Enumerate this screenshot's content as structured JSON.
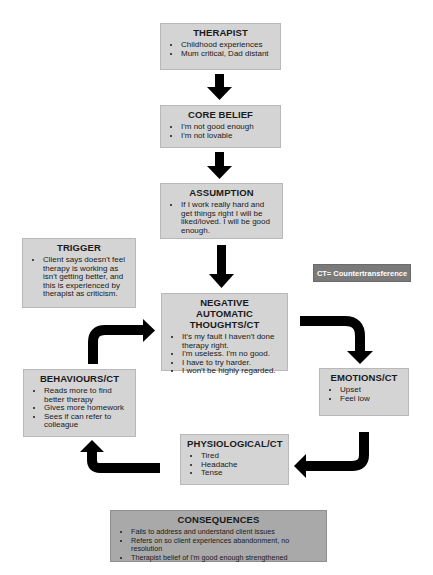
{
  "diagram": {
    "type": "cognitive-formulation-flowchart",
    "legend": {
      "label": "CT= Countertransference",
      "color": "#7a7a7a"
    },
    "colors": {
      "box_fill": "#d4d4d4",
      "consequences_fill": "#a9a9a9",
      "arrow": "#000000"
    },
    "boxes": {
      "therapist": {
        "title": "THERAPIST",
        "items": [
          "Childhood experiences",
          "Mum critical, Dad distant"
        ]
      },
      "core_belief": {
        "title": "CORE BELIEF",
        "items": [
          "I'm not good enough",
          "I'm not lovable"
        ]
      },
      "assumption": {
        "title": "ASSUMPTION",
        "items": [
          "If I work really hard and get things right I will be liked/loved. I will be good enough."
        ]
      },
      "trigger": {
        "title": "TRIGGER",
        "items": [
          "Client says doesn't feel therapy is working as isn't getting better, and this is experienced by therapist as criticism."
        ]
      },
      "negative_automatic_thoughts": {
        "title": "NEGATIVE AUTOMATIC THOUGHTS/CT",
        "items": [
          "It's my fault I haven't done therapy right.",
          "I'm useless. I'm no good.",
          "I have to try harder.",
          "I won't be highly regarded."
        ]
      },
      "emotions": {
        "title": "EMOTIONS/CT",
        "items": [
          "Upset",
          "Feel low"
        ]
      },
      "physiological": {
        "title": "PHYSIOLOGICAL/CT",
        "items": [
          "Tired",
          "Headache",
          "Tense"
        ]
      },
      "behaviours": {
        "title": "BEHAVIOURS/CT",
        "items": [
          "Reads more to find better therapy",
          "Gives more homework",
          "Sees if can refer to colleague"
        ]
      },
      "consequences": {
        "title": "CONSEQUENCES",
        "items": [
          "Fails to address and understand client issues",
          "Refers on so client experiences abandonment, no resolution",
          "Therapist belief of I'm good enough strengthened"
        ]
      }
    },
    "arrows": [
      {
        "from": "therapist",
        "to": "core_belief"
      },
      {
        "from": "core_belief",
        "to": "assumption"
      },
      {
        "from": "assumption",
        "to": "negative_automatic_thoughts"
      },
      {
        "from": "negative_automatic_thoughts",
        "to": "emotions"
      },
      {
        "from": "emotions",
        "to": "physiological"
      },
      {
        "from": "physiological",
        "to": "behaviours"
      },
      {
        "from": "behaviours",
        "to": "negative_automatic_thoughts"
      }
    ]
  }
}
